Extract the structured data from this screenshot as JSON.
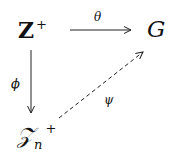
{
  "diagram": {
    "type": "commutative-diagram",
    "nodes": {
      "z_plus": {
        "base": "Z",
        "sup": "+"
      },
      "g": {
        "label": "G"
      },
      "zn_plus": {
        "base": "𝒵",
        "sub": "n",
        "sup": "+"
      }
    },
    "edges": [
      {
        "from": "Z+",
        "to": "G",
        "label": "θ",
        "style": "solid"
      },
      {
        "from": "Z+",
        "to": "𝒵n+",
        "label": "ϕ",
        "style": "solid"
      },
      {
        "from": "𝒵n+",
        "to": "G",
        "label": "ψ",
        "style": "dashed"
      }
    ],
    "labels": {
      "theta": "θ",
      "phi": "ϕ",
      "psi": "ψ"
    }
  }
}
